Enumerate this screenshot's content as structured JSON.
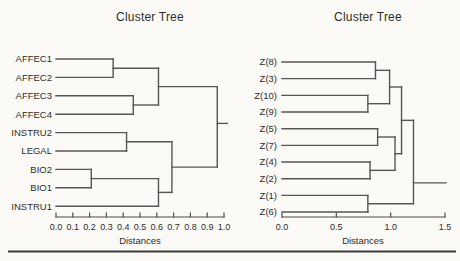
{
  "window": {
    "background": "#fbfaf7",
    "line_color": "#565656",
    "text_color": "#2d2d2d",
    "divider_color": "#3a3a3a"
  },
  "chart_data": [
    {
      "type": "dendrogram",
      "title": "Cluster Tree",
      "xlabel": "Distances",
      "orientation": "horizontal-right",
      "leaves": [
        "AFFEC1",
        "AFFEC2",
        "AFFEC3",
        "AFFEC4",
        "INSTRU2",
        "LEGAL",
        "BIO2",
        "BIO1",
        "INSTRU1"
      ],
      "merges": [
        {
          "id": "m0",
          "a": "AFFEC1",
          "b": "AFFEC2",
          "distance": 0.34
        },
        {
          "id": "m1",
          "a": "AFFEC3",
          "b": "AFFEC4",
          "distance": 0.46
        },
        {
          "id": "m2",
          "a": "m0",
          "b": "m1",
          "distance": 0.61
        },
        {
          "id": "m3",
          "a": "INSTRU2",
          "b": "LEGAL",
          "distance": 0.42
        },
        {
          "id": "m4",
          "a": "BIO2",
          "b": "BIO1",
          "distance": 0.21
        },
        {
          "id": "m5",
          "a": "m4",
          "b": "INSTRU1",
          "distance": 0.61
        },
        {
          "id": "m6",
          "a": "m3",
          "b": "m5",
          "distance": 0.69
        },
        {
          "id": "m7",
          "a": "m2",
          "b": "m6",
          "distance": 0.96
        }
      ],
      "root_extends_to": 1.02,
      "axis": {
        "min": 0.0,
        "max": 1.0,
        "ticks": [
          {
            "v": 0.0,
            "t": "0.0"
          },
          {
            "v": 0.1,
            "t": "0.1"
          },
          {
            "v": 0.2,
            "t": "0.2"
          },
          {
            "v": 0.3,
            "t": "0.3"
          },
          {
            "v": 0.4,
            "t": "0.4"
          },
          {
            "v": 0.5,
            "t": "0.5"
          },
          {
            "v": 0.6,
            "t": "0.6"
          },
          {
            "v": 0.7,
            "t": "0.7"
          },
          {
            "v": 0.8,
            "t": "0.8"
          },
          {
            "v": 0.9,
            "t": "0.9"
          },
          {
            "v": 1.0,
            "t": "1.0"
          }
        ]
      },
      "layout": {
        "root_stub_row": 3.5
      }
    },
    {
      "type": "dendrogram",
      "title": "Cluster Tree",
      "xlabel": "Distances",
      "orientation": "horizontal-right",
      "leaves": [
        "Z(8)",
        "Z(3)",
        "Z(10)",
        "Z(9)",
        "Z(5)",
        "Z(7)",
        "Z(4)",
        "Z(2)",
        "Z(1)",
        "Z(6)"
      ],
      "merges": [
        {
          "id": "m0",
          "a": "Z(8)",
          "b": "Z(3)",
          "distance": 0.86
        },
        {
          "id": "m1",
          "a": "Z(10)",
          "b": "Z(9)",
          "distance": 0.79
        },
        {
          "id": "m2",
          "a": "m0",
          "b": "m1",
          "distance": 0.99
        },
        {
          "id": "m3",
          "a": "Z(5)",
          "b": "Z(7)",
          "distance": 0.88
        },
        {
          "id": "m4",
          "a": "Z(4)",
          "b": "Z(2)",
          "distance": 0.81
        },
        {
          "id": "m5",
          "a": "m3",
          "b": "m4",
          "distance": 1.04
        },
        {
          "id": "m6",
          "a": "m2",
          "b": "m5",
          "distance": 1.1
        },
        {
          "id": "m7",
          "a": "Z(1)",
          "b": "Z(6)",
          "distance": 0.79
        },
        {
          "id": "m8",
          "a": "m6",
          "b": "m7",
          "distance": 1.21
        }
      ],
      "root_extends_to": 1.51,
      "axis": {
        "min": 0.0,
        "max": 1.5,
        "ticks": [
          {
            "v": 0.0,
            "t": "0.0"
          },
          {
            "v": 0.5,
            "t": "0.5"
          },
          {
            "v": 1.0,
            "t": "1.0"
          },
          {
            "v": 1.5,
            "t": "1.5"
          }
        ]
      },
      "layout": {
        "root_stub_row": 7.25
      }
    }
  ]
}
